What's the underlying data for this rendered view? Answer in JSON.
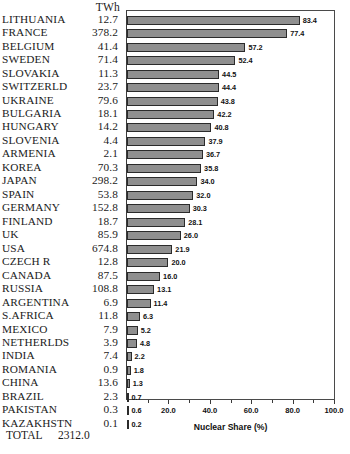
{
  "table": {
    "value_header": "TWh",
    "total_label": "TOTAL",
    "total_value": "2312.0"
  },
  "axis": {
    "title": "Nuclear Share (%)",
    "ticks": [
      "20.0",
      "40.0",
      "60.0",
      "80.0",
      "100.0"
    ],
    "tick_values": [
      20,
      40,
      60,
      80,
      100
    ]
  },
  "style": {
    "bar_fill": "#8f8f8f",
    "bar_border": "#2b2b2b",
    "frame": "#4a4a4a"
  },
  "chart_data": {
    "type": "bar",
    "orientation": "horizontal",
    "title": "",
    "xlabel": "Nuclear Share (%)",
    "ylabel": "",
    "xlim": [
      0,
      100
    ],
    "grid": false,
    "legend": false,
    "categories": [
      "LITHUANIA",
      "FRANCE",
      "BELGIUM",
      "SWEDEN",
      "SLOVAKIA",
      "SWITZERLD",
      "UKRAINE",
      "BULGARIA",
      "HUNGARY",
      "SLOVENIA",
      "ARMENIA",
      "KOREA",
      "JAPAN",
      "SPAIN",
      "GERMANY",
      "FINLAND",
      "UK",
      "USA",
      "CZECH  R",
      "CANADA",
      "RUSSIA",
      "ARGENTINA",
      "S.AFRICA",
      "MEXICO",
      "NETHERLDS",
      "INDIA",
      "ROMANIA",
      "CHINA",
      "BRAZIL",
      "PAKISTAN",
      "KAZAKHSTN"
    ],
    "series": [
      {
        "name": "Nuclear Share (%)",
        "values": [
          83.4,
          77.4,
          57.2,
          52.4,
          44.5,
          44.4,
          43.8,
          42.2,
          40.8,
          37.9,
          36.7,
          35.8,
          34.0,
          32.0,
          30.3,
          28.1,
          26.0,
          21.9,
          20.0,
          16.0,
          13.1,
          11.4,
          6.3,
          5.2,
          4.8,
          2.2,
          1.8,
          1.3,
          0.7,
          0.6,
          0.2
        ]
      },
      {
        "name": "TWh",
        "values": [
          12.7,
          378.2,
          41.4,
          71.4,
          11.3,
          23.7,
          79.6,
          18.1,
          14.2,
          4.4,
          2.1,
          70.3,
          298.2,
          53.8,
          152.8,
          18.7,
          85.9,
          674.8,
          12.8,
          87.5,
          108.8,
          6.9,
          11.8,
          7.9,
          3.9,
          7.4,
          0.9,
          13.6,
          2.3,
          0.3,
          0.1
        ]
      }
    ],
    "twh_labels": [
      "12.7",
      "378.2",
      "41.4",
      "71.4",
      "11.3",
      "23.7",
      "79.6",
      "18.1",
      "14.2",
      "4.4",
      "2.1",
      "70.3",
      "298.2",
      "53.8",
      "152.8",
      "18.7",
      "85.9",
      "674.8",
      "12.8",
      "87.5",
      "108.8",
      "6.9",
      "11.8",
      "7.9",
      "3.9",
      "7.4",
      "0.9",
      "13.6",
      "2.3",
      "0.3",
      "0.1"
    ],
    "share_labels": [
      "83.4",
      "77.4",
      "57.2",
      "52.4",
      "44.5",
      "44.4",
      "43.8",
      "42.2",
      "40.8",
      "37.9",
      "36.7",
      "35.8",
      "34.0",
      "32.0",
      "30.3",
      "28.1",
      "26.0",
      "21.9",
      "20.0",
      "16.0",
      "13.1",
      "11.4",
      "6.3",
      "5.2",
      "4.8",
      "2.2",
      "1.8",
      "1.3",
      "0.7",
      "0.6",
      "0.2"
    ]
  }
}
